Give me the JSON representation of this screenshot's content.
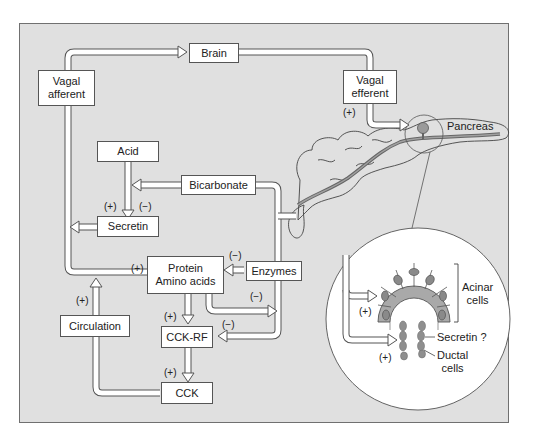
{
  "diagram": {
    "type": "physiological-regulation-flow",
    "colors": {
      "background": "#e0e0e0",
      "frame_border": "#707070",
      "box_fill": "#ffffff",
      "arrow_fill": "#ffffff",
      "arrow_stroke": "#555555",
      "acinar_fill": "#a9a9a9",
      "nucleus_fill": "#8a8a8a",
      "ductal_fill": "#8f8f8f"
    },
    "nodes": {
      "brain": "Brain",
      "vagal_afferent": "Vagal\nafferent",
      "vagal_efferent": "Vagal\nefferent",
      "acid": "Acid",
      "bicarbonate": "Bicarbonate",
      "secretin": "Secretin",
      "protein_amino_acids": "Protein\nAmino acids",
      "enzymes": "Enzymes",
      "cck_rf": "CCK-RF",
      "circulation": "Circulation",
      "cck": "CCK"
    },
    "labels": {
      "pancreas": "Pancreas",
      "acinar_cells": "Acinar\ncells",
      "secretin_q": "Secretin ?",
      "ductal_cells": "Ductal\ncells"
    },
    "signs": {
      "vagal_efferent_plus": "(+)",
      "acid_secretin_plus": "(+)",
      "bicarb_secretin_minus": "(−)",
      "protein_plus": "(+)",
      "enzymes_protein_minus": "(−)",
      "protein_out_minus": "(−)",
      "protein_cckrf_plus": "(+)",
      "enzymes_cckrf_minus": "(−)",
      "cckrf_cck_plus": "(+)",
      "circulation_plus": "(+)",
      "acinar_plus": "(+)",
      "ductal_plus": "(+)"
    },
    "edges": [
      {
        "from": "Vagal afferent",
        "to": "Brain",
        "sign": ""
      },
      {
        "from": "Brain",
        "to": "Vagal efferent",
        "sign": ""
      },
      {
        "from": "Vagal efferent",
        "to": "Pancreas",
        "sign": "+"
      },
      {
        "from": "Acid",
        "to": "Secretin",
        "sign": "+"
      },
      {
        "from": "Bicarbonate",
        "to": "Secretin",
        "sign": "-"
      },
      {
        "from": "Secretin",
        "to": "Circulation loop",
        "sign": ""
      },
      {
        "from": "Protein/Amino acids",
        "to": "Vagal afferent",
        "sign": "+"
      },
      {
        "from": "Enzymes",
        "to": "Protein/Amino acids",
        "sign": "-"
      },
      {
        "from": "Protein/Amino acids",
        "to": "CCK-RF",
        "sign": "+"
      },
      {
        "from": "Enzymes",
        "to": "CCK-RF",
        "sign": "-"
      },
      {
        "from": "CCK-RF",
        "to": "CCK",
        "sign": "+"
      },
      {
        "from": "CCK",
        "to": "Circulation",
        "sign": "+"
      },
      {
        "from": "Circulation",
        "to": "Acinar cells",
        "sign": "+"
      },
      {
        "from": "Circulation",
        "to": "Ductal cells",
        "sign": "+"
      }
    ]
  }
}
